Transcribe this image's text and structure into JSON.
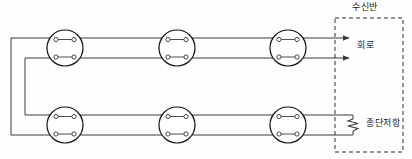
{
  "diagram": {
    "labels": {
      "receiver_panel": "수신반",
      "circuit": "회로",
      "terminating_resistor": "종단저항"
    },
    "colors": {
      "wire": "#3a3a3a",
      "device_outline": "#111111",
      "terminal_fill": "#ffffff",
      "dashed_box": "#2b2b2b",
      "background": "#fefefe",
      "text": "#1a1a1a"
    },
    "geometry": {
      "width": 412,
      "height": 159,
      "top_row_wires_y": [
        38,
        58
      ],
      "bottom_row_wires_y": [
        115,
        135
      ],
      "left_return_x": [
        11,
        25
      ],
      "dashed_box": {
        "x": 335,
        "y": 18,
        "width": 68,
        "height": 134
      },
      "arrow_tip_x": 349,
      "resistor_x": 353,
      "detector_radius": 18
    },
    "detectors": [
      {
        "id": "detector-top-1",
        "row": "top",
        "cx": 65,
        "cy": 48,
        "terminal_count": 4
      },
      {
        "id": "detector-top-2",
        "row": "top",
        "cx": 177,
        "cy": 48,
        "terminal_count": 4
      },
      {
        "id": "detector-top-3",
        "row": "top",
        "cx": 288,
        "cy": 48,
        "terminal_count": 4
      },
      {
        "id": "detector-bottom-1",
        "row": "bottom",
        "cx": 65,
        "cy": 125,
        "terminal_count": 4
      },
      {
        "id": "detector-bottom-2",
        "row": "bottom",
        "cx": 177,
        "cy": 125,
        "terminal_count": 4
      },
      {
        "id": "detector-bottom-3",
        "row": "bottom",
        "cx": 288,
        "cy": 125,
        "terminal_count": 4
      }
    ],
    "arrows": [
      {
        "id": "arrow-circuit-line-1",
        "y": 38
      },
      {
        "id": "arrow-circuit-line-2",
        "y": 58
      }
    ]
  }
}
